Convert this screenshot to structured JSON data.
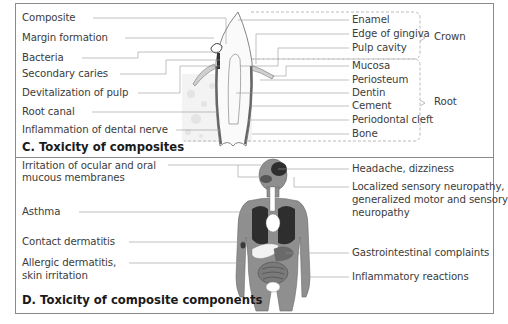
{
  "panel_c": {
    "title": "C. Toxicity of composites",
    "left_labels": [
      "Composite",
      "Margin formation",
      "Bacteria",
      "Secondary caries",
      "Devitalization of pulp",
      "Root canal",
      "Inflammation of dental nerve"
    ],
    "right_labels": [
      "Enamel",
      "Edge of gingiva",
      "Pulp cavity",
      "Mucosa",
      "Periosteum",
      "Dentin",
      "Cement",
      "Periodontal cleft",
      "Bone"
    ],
    "groups": [
      {
        "label": "Crown",
        "members": [
          "Enamel",
          "Edge of gingiva",
          "Pulp cavity"
        ]
      },
      {
        "label": "Root",
        "members": [
          "Mucosa",
          "Periosteum",
          "Dentin",
          "Cement",
          "Periodontal cleft",
          "Bone"
        ]
      }
    ],
    "figure": "tooth-cross-section"
  },
  "panel_d": {
    "title": "D. Toxicity of composite components",
    "left_labels": [
      {
        "line1": "Irritation of ocular and oral",
        "line2": "mucous membranes"
      },
      {
        "line1": "Asthma"
      },
      {
        "line1": "Contact dermatitis"
      },
      {
        "line1": "Allergic dermatitis,",
        "line2": "skin irritation"
      }
    ],
    "right_labels": [
      {
        "line1": "Headache, dizziness"
      },
      {
        "line1": "Localized sensory neuropathy,",
        "line2": "generalized motor and sensory",
        "line3": "neuropathy"
      },
      {
        "line1": "Gastrointestinal complaints"
      },
      {
        "line1": "Inflammatory reactions"
      }
    ],
    "figure": "human-body-organs"
  },
  "colors": {
    "border": "#8a8a8a",
    "leader_line": "#9a9a9a",
    "body_fill": "#8f8f8f",
    "organ_dark": "#2e2e2e",
    "text": "#3c3c3c"
  }
}
